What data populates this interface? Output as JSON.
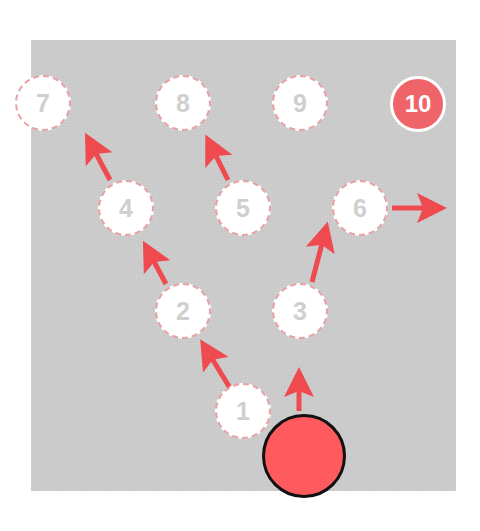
{
  "board": {
    "background": "#c9c9c9",
    "arrow_color": "#ef4a50",
    "node_border_color": "#e8a0a3",
    "goal_color": "#ef6468",
    "player_color": "#ff5a5e"
  },
  "nodes": [
    {
      "id": "1",
      "label": "1",
      "x": 243,
      "y": 411
    },
    {
      "id": "2",
      "label": "2",
      "x": 183,
      "y": 311
    },
    {
      "id": "3",
      "label": "3",
      "x": 300,
      "y": 311
    },
    {
      "id": "4",
      "label": "4",
      "x": 126,
      "y": 208
    },
    {
      "id": "5",
      "label": "5",
      "x": 243,
      "y": 208
    },
    {
      "id": "6",
      "label": "6",
      "x": 360,
      "y": 208
    },
    {
      "id": "7",
      "label": "7",
      "x": 43,
      "y": 103
    },
    {
      "id": "8",
      "label": "8",
      "x": 183,
      "y": 103
    },
    {
      "id": "9",
      "label": "9",
      "x": 300,
      "y": 103
    },
    {
      "id": "10",
      "label": "10",
      "x": 418,
      "y": 104,
      "highlighted": true
    }
  ],
  "arrows": [
    {
      "from": "1",
      "to": "2",
      "direction": "up-left"
    },
    {
      "from": "2",
      "to": "4",
      "direction": "up-left"
    },
    {
      "from": "4",
      "to": "7",
      "direction": "up-left"
    },
    {
      "from": "5",
      "to": "8",
      "direction": "up-left"
    },
    {
      "from": "player",
      "to": "3",
      "direction": "up"
    },
    {
      "from": "3",
      "to": "6",
      "direction": "up-right"
    },
    {
      "from": "6",
      "to": "exit",
      "direction": "right"
    }
  ],
  "player": {
    "x": 303,
    "y": 455,
    "radius": 41
  }
}
